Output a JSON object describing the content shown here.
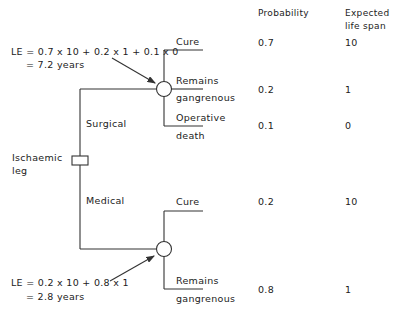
{
  "headers": {
    "probability": "Probability",
    "expected_line1": "Expected",
    "expected_line2": "life span"
  },
  "root": {
    "label_line1": "Ischaemic",
    "label_line2": "leg",
    "node_type": "decision-square"
  },
  "branches": [
    {
      "name": "Surgical",
      "node_type": "chance-circle",
      "le_line1": "LE = 0.7 x 10  +  0.2 x 1  +  0.1 x 0",
      "le_line2": "= 7.2 years",
      "outcomes": [
        {
          "line1": "Cure",
          "line2": "",
          "probability": "0.7",
          "life_span": "10"
        },
        {
          "line1": "Remains",
          "line2": "gangrenous",
          "probability": "0.2",
          "life_span": "1"
        },
        {
          "line1": "Operative",
          "line2": "death",
          "probability": "0.1",
          "life_span": "0"
        }
      ]
    },
    {
      "name": "Medical",
      "node_type": "chance-circle",
      "le_line1": "LE = 0.2 x 10  +  0.8 x 1",
      "le_line2": "= 2.8 years",
      "outcomes": [
        {
          "line1": "Cure",
          "line2": "",
          "probability": "0.2",
          "life_span": "10"
        },
        {
          "line1": "Remains",
          "line2": "gangrenous",
          "probability": "0.8",
          "life_span": "1"
        }
      ]
    }
  ],
  "colors": {
    "line": "#333333",
    "text": "#222222",
    "background": "#ffffff"
  }
}
